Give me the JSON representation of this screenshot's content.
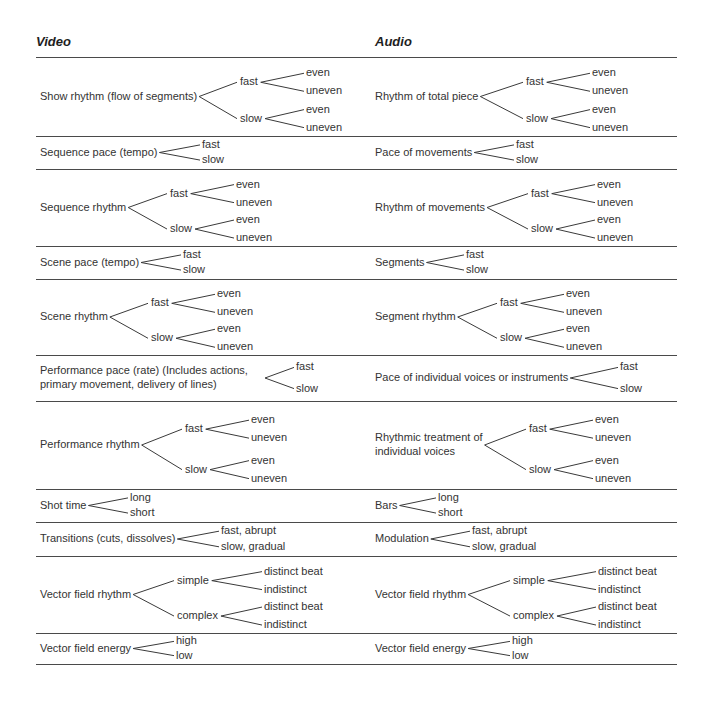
{
  "headers": {
    "video": "Video",
    "audio": "Audio"
  },
  "rules_y": [
    57,
    136,
    169,
    246,
    279,
    355,
    401,
    489,
    522,
    556,
    633,
    664
  ],
  "video": [
    {
      "label": "Show rhythm (flow of segments)",
      "children": [
        {
          "label": "fast",
          "children": [
            "even",
            "uneven"
          ]
        },
        {
          "label": "slow",
          "children": [
            "even",
            "uneven"
          ]
        }
      ]
    },
    {
      "label": "Sequence pace (tempo)",
      "children": [
        "fast",
        "slow"
      ]
    },
    {
      "label": "Sequence rhythm",
      "children": [
        {
          "label": "fast",
          "children": [
            "even",
            "uneven"
          ]
        },
        {
          "label": "slow",
          "children": [
            "even",
            "uneven"
          ]
        }
      ]
    },
    {
      "label": "Scene pace (tempo)",
      "children": [
        "fast",
        "slow"
      ]
    },
    {
      "label": "Scene rhythm",
      "children": [
        {
          "label": "fast",
          "children": [
            "even",
            "uneven"
          ]
        },
        {
          "label": "slow",
          "children": [
            "even",
            "uneven"
          ]
        }
      ]
    },
    {
      "label": "Performance pace (rate) (Includes actions, primary movement, delivery of lines)",
      "label_lines": [
        "Performance pace (rate) (Includes actions,",
        "primary movement, delivery of lines)"
      ],
      "children": [
        "fast",
        "slow"
      ]
    },
    {
      "label": "Performance rhythm",
      "children": [
        {
          "label": "fast",
          "children": [
            "even",
            "uneven"
          ]
        },
        {
          "label": "slow",
          "children": [
            "even",
            "uneven"
          ]
        }
      ]
    },
    {
      "label": "Shot time",
      "children": [
        "long",
        "short"
      ]
    },
    {
      "label": "Transitions (cuts, dissolves)",
      "children": [
        "fast, abrupt",
        "slow, gradual"
      ]
    },
    {
      "label": "Vector field rhythm",
      "children": [
        {
          "label": "simple",
          "children": [
            "distinct beat",
            "indistinct"
          ]
        },
        {
          "label": "complex",
          "children": [
            "distinct beat",
            "indistinct"
          ]
        }
      ]
    },
    {
      "label": "Vector field energy",
      "children": [
        "high",
        "low"
      ]
    }
  ],
  "audio": [
    {
      "label": "Rhythm of total piece",
      "children": [
        {
          "label": "fast",
          "children": [
            "even",
            "uneven"
          ]
        },
        {
          "label": "slow",
          "children": [
            "even",
            "uneven"
          ]
        }
      ]
    },
    {
      "label": "Pace of movements",
      "children": [
        "fast",
        "slow"
      ]
    },
    {
      "label": "Rhythm of movements",
      "children": [
        {
          "label": "fast",
          "children": [
            "even",
            "uneven"
          ]
        },
        {
          "label": "slow",
          "children": [
            "even",
            "uneven"
          ]
        }
      ]
    },
    {
      "label": "Segments",
      "children": [
        "fast",
        "slow"
      ]
    },
    {
      "label": "Segment rhythm",
      "children": [
        {
          "label": "fast",
          "children": [
            "even",
            "uneven"
          ]
        },
        {
          "label": "slow",
          "children": [
            "even",
            "uneven"
          ]
        }
      ]
    },
    {
      "label": "Pace of individual voices or instruments",
      "children": [
        "fast",
        "slow"
      ]
    },
    {
      "label": "Rhythmic treatment of individual voices",
      "label_lines": [
        "Rhythmic treatment of",
        "individual voices"
      ],
      "children": [
        {
          "label": "fast",
          "children": [
            "even",
            "uneven"
          ]
        },
        {
          "label": "slow",
          "children": [
            "even",
            "uneven"
          ]
        }
      ]
    },
    {
      "label": "Bars",
      "children": [
        "long",
        "short"
      ]
    },
    {
      "label": "Modulation",
      "children": [
        "fast, abrupt",
        "slow, gradual"
      ]
    },
    {
      "label": "Vector field rhythm",
      "children": [
        {
          "label": "simple",
          "children": [
            "distinct beat",
            "indistinct"
          ]
        },
        {
          "label": "complex",
          "children": [
            "distinct beat",
            "indistinct"
          ]
        }
      ]
    },
    {
      "label": "Vector field energy",
      "children": [
        "high",
        "low"
      ]
    }
  ]
}
